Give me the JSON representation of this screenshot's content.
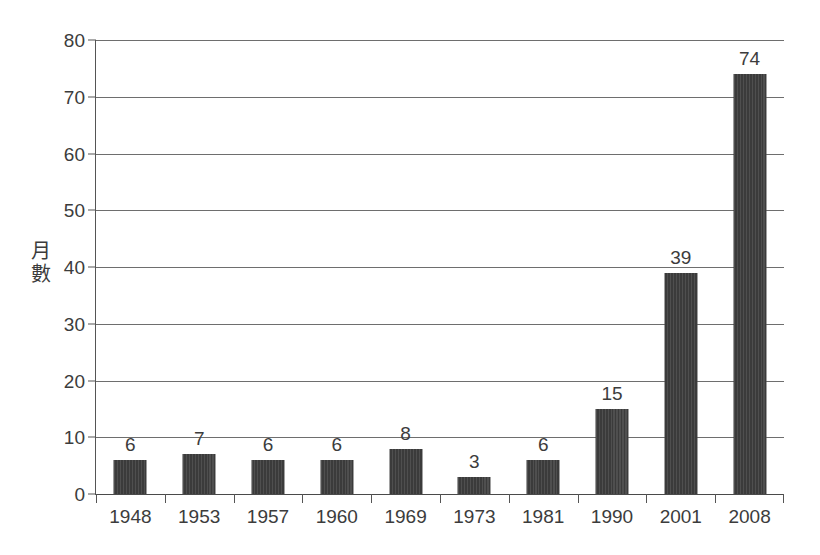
{
  "chart_data": {
    "type": "bar",
    "title": "",
    "subtitle": "",
    "xlabel": "",
    "ylabel": "月數",
    "ylabel_chars": [
      "月",
      "數"
    ],
    "categories": [
      "1948",
      "1953",
      "1957",
      "1960",
      "1969",
      "1973",
      "1981",
      "1990",
      "2001",
      "2008"
    ],
    "values": [
      6,
      7,
      6,
      6,
      8,
      3,
      6,
      15,
      39,
      74
    ],
    "value_labels": [
      "6",
      "7",
      "6",
      "6",
      "8",
      "3",
      "6",
      "15",
      "39",
      "74"
    ],
    "ylim": [
      0,
      80
    ],
    "y_ticks": [
      0,
      10,
      20,
      30,
      40,
      50,
      60,
      70,
      80
    ],
    "y_tick_labels": [
      "0",
      "10",
      "20",
      "30",
      "40",
      "50",
      "60",
      "70",
      "80"
    ],
    "grid": true,
    "grid_axis": "y",
    "legend": false,
    "legend_position": "none",
    "bar_color": "#3b3b3b",
    "grid_color": "#6e6e6e",
    "axis_color": "#555555",
    "text_color": "#3c3c3c",
    "background_color": "#ffffff"
  }
}
